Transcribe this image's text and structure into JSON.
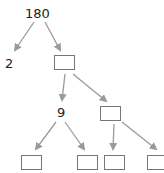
{
  "tree": {
    "root": {
      "label": "180",
      "x": 25,
      "y": 7
    },
    "nodes": [
      {
        "id": "n2",
        "label": "2",
        "type": "text",
        "x": 5,
        "y": 57
      },
      {
        "id": "b1",
        "label": "",
        "type": "box",
        "x": 54,
        "y": 55,
        "w": 21,
        "h": 15
      },
      {
        "id": "n9",
        "label": "9",
        "type": "text",
        "x": 57,
        "y": 106
      },
      {
        "id": "b2",
        "label": "",
        "type": "box",
        "x": 100,
        "y": 106,
        "w": 21,
        "h": 15
      },
      {
        "id": "b3",
        "label": "",
        "type": "box",
        "x": 21,
        "y": 155,
        "w": 21,
        "h": 15
      },
      {
        "id": "b4",
        "label": "",
        "type": "box",
        "x": 77,
        "y": 155,
        "w": 21,
        "h": 15
      },
      {
        "id": "b5",
        "label": "",
        "type": "box",
        "x": 104,
        "y": 155,
        "w": 21,
        "h": 15
      },
      {
        "id": "b6",
        "label": "",
        "type": "box",
        "x": 147,
        "y": 155,
        "w": 21,
        "h": 15
      }
    ],
    "edges": [
      {
        "from": "180",
        "to": "2"
      },
      {
        "from": "180",
        "to": "b1"
      },
      {
        "from": "b1",
        "to": "9"
      },
      {
        "from": "b1",
        "to": "b2"
      },
      {
        "from": "9",
        "to": "b3"
      },
      {
        "from": "9",
        "to": "b4"
      },
      {
        "from": "b2",
        "to": "b5"
      },
      {
        "from": "b2",
        "to": "b6"
      }
    ],
    "colors": {
      "arrow": "#9a9a9a",
      "box_border": "#777777",
      "text": "#222222"
    }
  }
}
